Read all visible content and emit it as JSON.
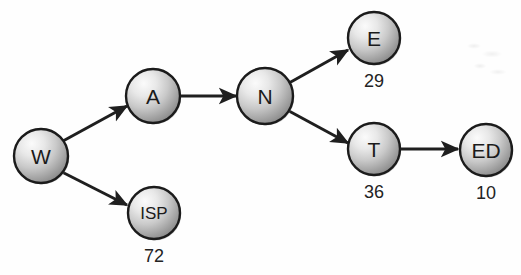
{
  "diagram": {
    "type": "directed-graph",
    "title": "",
    "background_color": "#fefefe",
    "node_fill_light": "#f2f2f2",
    "node_fill_dark": "#8c8c8c",
    "node_stroke_color": "#1b1b1b",
    "edge_color": "#1f1f1f",
    "label_color": "#1b1b1b",
    "value_color": "#232323",
    "nodes": [
      {
        "id": "W",
        "label": "W",
        "value": "",
        "cx": 41,
        "cy": 156,
        "r": 27
      },
      {
        "id": "A",
        "label": "A",
        "value": "",
        "cx": 153,
        "cy": 96,
        "r": 27
      },
      {
        "id": "ISP",
        "label": "ISP",
        "value": "72",
        "cx": 154,
        "cy": 213,
        "r": 26
      },
      {
        "id": "N",
        "label": "N",
        "value": "",
        "cx": 265,
        "cy": 96,
        "r": 28
      },
      {
        "id": "E",
        "label": "E",
        "value": "29",
        "cx": 374,
        "cy": 38,
        "r": 26
      },
      {
        "id": "T",
        "label": "T",
        "value": "36",
        "cx": 374,
        "cy": 149,
        "r": 26
      },
      {
        "id": "ED",
        "label": "ED",
        "value": "10",
        "cx": 486,
        "cy": 150,
        "r": 26
      }
    ],
    "edges": [
      {
        "from": "W",
        "to": "A",
        "x1": 63,
        "y1": 141,
        "x2": 127,
        "y2": 106
      },
      {
        "from": "W",
        "to": "ISP",
        "x1": 62,
        "y1": 172,
        "x2": 127,
        "y2": 205
      },
      {
        "from": "A",
        "to": "N",
        "x1": 181,
        "y1": 96,
        "x2": 236,
        "y2": 96
      },
      {
        "from": "N",
        "to": "E",
        "x1": 289,
        "y1": 83,
        "x2": 348,
        "y2": 50
      },
      {
        "from": "N",
        "to": "T",
        "x1": 289,
        "y1": 111,
        "x2": 348,
        "y2": 143
      },
      {
        "from": "T",
        "to": "ED",
        "x1": 401,
        "y1": 149,
        "x2": 458,
        "y2": 149
      }
    ]
  }
}
